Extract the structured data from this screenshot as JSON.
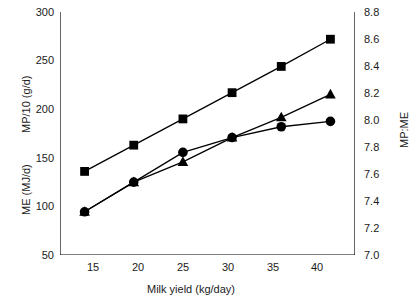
{
  "chart_data": {
    "type": "line",
    "title": "",
    "xlabel": "Milk yield (kg/day)",
    "ylabel_left": "ME (MJ/d)   MP/10 (g/d)",
    "ylabel_left_part1": "ME (MJ/d)",
    "ylabel_left_part2": "MP/10 (g/d)",
    "ylabel_right": "MP:ME",
    "x": [
      15,
      20,
      25,
      30,
      35,
      40
    ],
    "xticklabels": [
      "15",
      "20",
      "25",
      "30",
      "35",
      "40"
    ],
    "xlim": [
      12.5,
      42.5
    ],
    "ylim_left": [
      50,
      300
    ],
    "yticks_left": [
      50,
      100,
      150,
      200,
      250,
      300
    ],
    "yticklabels_left": [
      "50",
      "100",
      "150",
      "200",
      "250",
      "300"
    ],
    "ylim_right": [
      7.0,
      8.8
    ],
    "yticks_right": [
      7.0,
      7.2,
      7.4,
      7.6,
      7.8,
      8.0,
      8.2,
      8.4,
      8.6,
      8.8
    ],
    "yticklabels_right": [
      "7.0",
      "7.2",
      "7.4",
      "7.6",
      "7.8",
      "8.0",
      "8.2",
      "8.4",
      "8.6",
      "8.8"
    ],
    "grid": false,
    "legend": "none",
    "series": [
      {
        "name": "ME (MJ/d) and MP/10 (g/d)",
        "marker": "square",
        "axis": "left",
        "values": [
          136,
          163,
          190,
          217,
          244,
          272
        ]
      },
      {
        "name": "MP:ME (circle series)",
        "marker": "circle",
        "axis": "right",
        "values": [
          7.32,
          7.54,
          7.76,
          7.87,
          7.95,
          7.99
        ]
      },
      {
        "name": "MP:ME (triangle series)",
        "marker": "triangle",
        "axis": "right",
        "values": [
          7.32,
          7.54,
          7.69,
          7.87,
          8.02,
          8.19
        ]
      }
    ],
    "colors": {
      "line": "#000000",
      "marker": "#000000",
      "axis": "#000000",
      "text": "#1a1a1a",
      "background": "#ffffff"
    }
  }
}
